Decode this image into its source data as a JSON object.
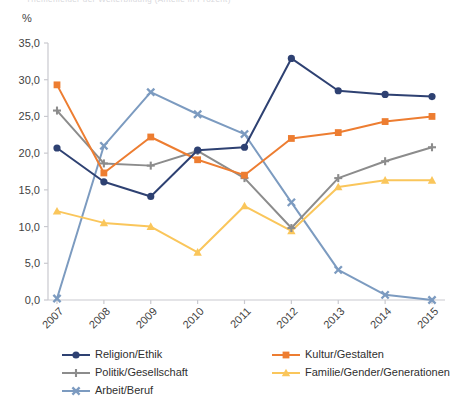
{
  "cut_title": "Themenfelder der Weiterbildung (Anteile in Prozent)",
  "axis_unit_label": "%",
  "chart_data": {
    "type": "line",
    "title": "",
    "subtitle": "",
    "xlabel": "",
    "ylabel": "%",
    "ylim": [
      0,
      35
    ],
    "ytick_labels": [
      "0,0",
      "5,0",
      "10,0",
      "15,0",
      "20,0",
      "25,0",
      "30,0",
      "35,0"
    ],
    "ytick_values": [
      0,
      5,
      10,
      15,
      20,
      25,
      30,
      35
    ],
    "grid": false,
    "legend_position": "bottom",
    "categories": [
      "2007",
      "2008",
      "2009",
      "2010",
      "2011",
      "2012",
      "2013",
      "2014",
      "2015"
    ],
    "series": [
      {
        "name": "Religion/Ethik",
        "color": "#2E4172",
        "marker": "circle",
        "values": [
          20.7,
          16.1,
          14.1,
          20.4,
          20.8,
          32.9,
          28.5,
          28.0,
          27.7
        ]
      },
      {
        "name": "Kultur/Gestalten",
        "color": "#ED7D31",
        "marker": "square",
        "values": [
          29.3,
          17.3,
          22.2,
          19.1,
          17.0,
          22.0,
          22.8,
          24.3,
          25.0
        ]
      },
      {
        "name": "Politik/Gesellschaft",
        "color": "#8C8C8C",
        "marker": "plus",
        "values": [
          25.8,
          18.6,
          18.3,
          20.3,
          16.6,
          9.8,
          16.6,
          18.9,
          20.8
        ]
      },
      {
        "name": "Familie/Gender/Generationen",
        "color": "#FAC65B",
        "marker": "triangle",
        "values": [
          12.1,
          10.5,
          10.0,
          6.5,
          12.8,
          9.4,
          15.4,
          16.3,
          16.3
        ]
      },
      {
        "name": "Arbeit/Beruf",
        "color": "#7C9BC0",
        "marker": "cross",
        "values": [
          0.2,
          21.0,
          28.3,
          25.3,
          22.6,
          13.3,
          4.1,
          0.7,
          0.0
        ]
      }
    ]
  },
  "legend": {
    "items": [
      {
        "label": "Religion/Ethik",
        "color": "#2E4172",
        "marker": "circle"
      },
      {
        "label": "Kultur/Gestalten",
        "color": "#ED7D31",
        "marker": "square"
      },
      {
        "label": "Politik/Gesellschaft",
        "color": "#8C8C8C",
        "marker": "plus"
      },
      {
        "label": "Familie/Gender/Generationen",
        "color": "#FAC65B",
        "marker": "triangle"
      },
      {
        "label": "Arbeit/Beruf",
        "color": "#7C9BC0",
        "marker": "cross"
      }
    ]
  }
}
